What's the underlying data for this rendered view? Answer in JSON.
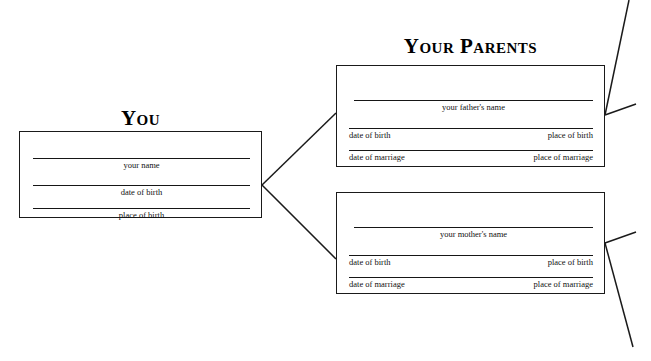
{
  "document": {
    "type": "genealogy-family-tree-worksheet",
    "background_color": "#ffffff",
    "ink_color": "#000000"
  },
  "sections": {
    "you": {
      "heading": "You",
      "fields": [
        {
          "label": "your name",
          "align": "center"
        },
        {
          "label": "date of birth",
          "align": "center"
        },
        {
          "label": "place of birth",
          "align": "center"
        }
      ]
    },
    "parents": {
      "heading": "Your Parents",
      "father": {
        "fields": [
          {
            "label": "your father's name",
            "align": "center"
          },
          {
            "label": "date of birth",
            "align": "left"
          },
          {
            "label": "place of birth",
            "align": "right"
          },
          {
            "label": "date of marriage",
            "align": "left"
          },
          {
            "label": "place of marriage",
            "align": "right"
          }
        ]
      },
      "mother": {
        "fields": [
          {
            "label": "your mother's name",
            "align": "center"
          },
          {
            "label": "date of birth",
            "align": "left"
          },
          {
            "label": "place of birth",
            "align": "right"
          },
          {
            "label": "date of marriage",
            "align": "left"
          },
          {
            "label": "place of marriage",
            "align": "right"
          }
        ]
      }
    }
  }
}
